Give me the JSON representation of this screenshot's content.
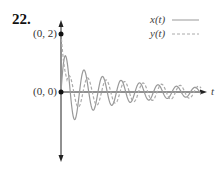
{
  "problem": {
    "number": "22."
  },
  "chart_data": {
    "type": "line",
    "title": "",
    "xlabel": "t",
    "ylabel": "",
    "annotations": [
      {
        "label": "(0, 2)",
        "t": 0,
        "y": 2
      },
      {
        "label": "(0, 0)",
        "t": 0,
        "y": 0
      }
    ],
    "legend": {
      "position": "top-right",
      "entries": [
        {
          "name": "x(t)",
          "style": "solid"
        },
        {
          "name": "y(t)",
          "style": "dashed"
        }
      ]
    },
    "series": [
      {
        "name": "x(t)",
        "style": "solid",
        "description": "damped oscillation starting at (0,0), first peak ≈1.4, decaying amplitude"
      },
      {
        "name": "y(t)",
        "style": "dashed",
        "description": "damped oscillation starting at (0,2), phase-shifted relative to x(t), decaying amplitude"
      }
    ],
    "grid": false,
    "ylim": [
      -2.3,
      2.4
    ]
  },
  "labels": {
    "point_top": "(0, 2)",
    "point_origin": "(0, 0)",
    "axis_t": "t",
    "legend_x": "x(t)",
    "legend_y": "y(t)"
  }
}
